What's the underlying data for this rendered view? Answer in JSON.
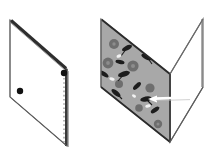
{
  "figure": {
    "title": "Folding diagram: flat patterned sheet and the same sheet folded along its vertical centre crease",
    "background_color": "#ffffff",
    "panels": [
      {
        "id": "left-panel",
        "name": "flat-sheet-panel",
        "label": "",
        "description": "Unfolded rectangular sheet shown in oblique projection as a parallelogram, plain white face, thick dark grey edge along the top and along the right side, with two small black dots and a vertical dashed crease line.",
        "outline_color": "#555555",
        "face_color": "#ffffff",
        "thick_edge_color": "#333333",
        "polygon": "10,20 67,69 67,146 10,97",
        "markers": [
          {
            "id": "dot-upper-right",
            "name": "black-dot-upper",
            "cx": 64,
            "cy": 73,
            "r": 3.2,
            "color": "#111111"
          },
          {
            "id": "dot-lower-left",
            "name": "black-dot-lower",
            "cx": 20,
            "cy": 91,
            "r": 3.2,
            "color": "#111111"
          }
        ],
        "crease": {
          "id": "dashed-crease",
          "name": "dashed-crease-line",
          "x1": 64,
          "y1": 78,
          "x2": 64,
          "y2": 143,
          "color": "#9a9a9a",
          "dash": "1.6 2.6",
          "width": 1.4
        }
      },
      {
        "id": "right-panel",
        "name": "folded-sheet-panel",
        "label": "",
        "description": "The same sheet folded 90 degrees along its centre crease, forming a V seen from above. The near-left face is shaded grey and covered with a dark floral and leaf print; the far-right face is plain white.",
        "outline_color": "#555555",
        "patterned_face_color": "#a8a8a8",
        "plain_face_color": "#ffffff",
        "fold_edge_color": "#333333",
        "patterned_polygon": "101,19 170,74 170,142 101,87",
        "plain_polygon": "170,74 203,19 203,87 170,142",
        "arrow": {
          "id": "white-arrow",
          "name": "direction-arrow",
          "color": "#ffffff",
          "outline_color": "#4a4a4a",
          "tail_x": 190,
          "tail_y": 97,
          "tip_x": 150,
          "tip_y": 99,
          "width": 2.4
        }
      }
    ],
    "pattern": {
      "name": "floral-leaf-print",
      "base_color": "#a8a8a8",
      "flower_color": "#6e6e6e",
      "leaf_color": "#1d1d1d",
      "highlight_color": "#f2f2f2",
      "flowers": [
        {
          "cx": 114,
          "cy": 44,
          "r": 5.0
        },
        {
          "cx": 141,
          "cy": 41,
          "r": 4.2
        },
        {
          "cx": 108,
          "cy": 63,
          "r": 5.4
        },
        {
          "cx": 133,
          "cy": 66,
          "r": 5.6
        },
        {
          "cx": 119,
          "cy": 84,
          "r": 4.0
        },
        {
          "cx": 150,
          "cy": 88,
          "r": 4.6
        },
        {
          "cx": 112,
          "cy": 104,
          "r": 4.4
        },
        {
          "cx": 139,
          "cy": 108,
          "r": 3.8
        },
        {
          "cx": 158,
          "cy": 124,
          "r": 4.2
        },
        {
          "cx": 128,
          "cy": 126,
          "r": 3.6
        }
      ],
      "leaves": [
        {
          "cx": 127,
          "cy": 48,
          "rx": 5.5,
          "ry": 2.4,
          "rot": -28
        },
        {
          "cx": 147,
          "cy": 57,
          "rx": 6.0,
          "ry": 2.6,
          "rot": 22
        },
        {
          "cx": 104,
          "cy": 74,
          "rx": 5.2,
          "ry": 2.2,
          "rot": 34
        },
        {
          "cx": 124,
          "cy": 74,
          "rx": 6.2,
          "ry": 2.6,
          "rot": -18
        },
        {
          "cx": 116,
          "cy": 93,
          "rx": 5.6,
          "ry": 2.4,
          "rot": 40
        },
        {
          "cx": 146,
          "cy": 99,
          "rx": 5.8,
          "ry": 2.5,
          "rot": -12
        },
        {
          "cx": 131,
          "cy": 114,
          "rx": 6.0,
          "ry": 2.5,
          "rot": 26
        },
        {
          "cx": 155,
          "cy": 110,
          "rx": 4.8,
          "ry": 2.2,
          "rot": -34
        },
        {
          "cx": 120,
          "cy": 62,
          "rx": 4.6,
          "ry": 2.0,
          "rot": 12
        },
        {
          "cx": 137,
          "cy": 86,
          "rx": 5.0,
          "ry": 2.2,
          "rot": -44
        }
      ],
      "highlights": [
        {
          "cx": 119,
          "cy": 56,
          "rx": 2.6,
          "ry": 1.5,
          "rot": -20
        },
        {
          "cx": 112,
          "cy": 79,
          "rx": 2.8,
          "ry": 1.6,
          "rot": 18
        },
        {
          "cx": 148,
          "cy": 106,
          "rx": 2.8,
          "ry": 1.6,
          "rot": -10
        },
        {
          "cx": 134,
          "cy": 96,
          "rx": 2.2,
          "ry": 1.3,
          "rot": 30
        }
      ]
    }
  }
}
